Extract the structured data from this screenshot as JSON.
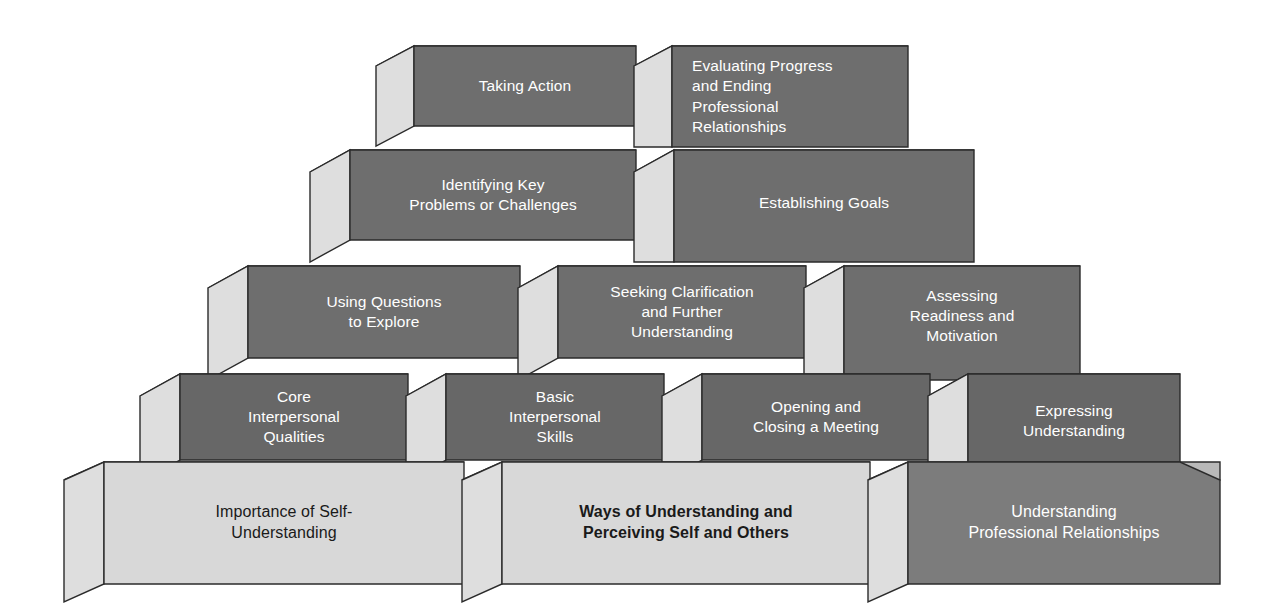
{
  "diagram": {
    "type": "stacked-block-pyramid",
    "background_color": "#ffffff",
    "palette": {
      "front_dark": "#6e6e6e",
      "front_darker": "#676767",
      "front_medium": "#7c7c7c",
      "front_light": "#d8d8d8",
      "top_face": "#b9b9b9",
      "side_face": "#dedede",
      "outline": "#2b2b2b",
      "text_light": "#ffffff",
      "text_dark": "#1a1a1a"
    },
    "rows": [
      {
        "index": 1,
        "position": "top",
        "blocks": [
          {
            "id": "taking-action",
            "label": "Taking Action",
            "align": "center",
            "text_style": "light",
            "face": "front_dark"
          },
          {
            "id": "evaluating-progress",
            "label": "Evaluating Progress\nand Ending\nProfessional\nRelationships",
            "align": "left",
            "text_style": "light",
            "face": "front_dark"
          }
        ]
      },
      {
        "index": 2,
        "blocks": [
          {
            "id": "identifying-key-problems",
            "label": "Identifying Key\nProblems or Challenges",
            "align": "center",
            "text_style": "light",
            "face": "front_dark"
          },
          {
            "id": "establishing-goals",
            "label": "Establishing Goals",
            "align": "center",
            "text_style": "light",
            "face": "front_dark"
          }
        ]
      },
      {
        "index": 3,
        "blocks": [
          {
            "id": "using-questions",
            "label": "Using Questions\nto  Explore",
            "align": "center",
            "text_style": "light",
            "face": "front_dark"
          },
          {
            "id": "seeking-clarification",
            "label": "Seeking Clarification\nand Further\nUnderstanding",
            "align": "center",
            "text_style": "light",
            "face": "front_dark"
          },
          {
            "id": "assessing-readiness",
            "label": "Assessing\nReadiness and\nMotivation",
            "align": "center",
            "text_style": "light",
            "face": "front_dark"
          }
        ]
      },
      {
        "index": 4,
        "blocks": [
          {
            "id": "core-interpersonal-qualities",
            "label": "Core\nInterpersonal\nQualities",
            "align": "center",
            "text_style": "light",
            "face": "front_darker"
          },
          {
            "id": "basic-interpersonal-skills",
            "label": "Basic\nInterpersonal\nSkills",
            "align": "center",
            "text_style": "light",
            "face": "front_darker"
          },
          {
            "id": "opening-closing-meeting",
            "label": "Opening and\nClosing a Meeting",
            "align": "center",
            "text_style": "light",
            "face": "front_darker"
          },
          {
            "id": "expressing-understanding",
            "label": "Expressing\nUnderstanding",
            "align": "center",
            "text_style": "light",
            "face": "front_darker"
          }
        ]
      },
      {
        "index": 5,
        "position": "base",
        "blocks": [
          {
            "id": "importance-of-self-understanding",
            "label": "Importance of Self-\nUnderstanding",
            "align": "center",
            "text_style": "dark",
            "face": "front_light"
          },
          {
            "id": "ways-of-understanding",
            "label": "Ways of Understanding and\nPerceiving Self and Others",
            "align": "center",
            "text_style": "dark-bold",
            "face": "front_light"
          },
          {
            "id": "understanding-professional-relationships",
            "label": "Understanding\nProfessional Relationships",
            "align": "center",
            "text_style": "light",
            "face": "front_medium"
          }
        ]
      }
    ]
  }
}
